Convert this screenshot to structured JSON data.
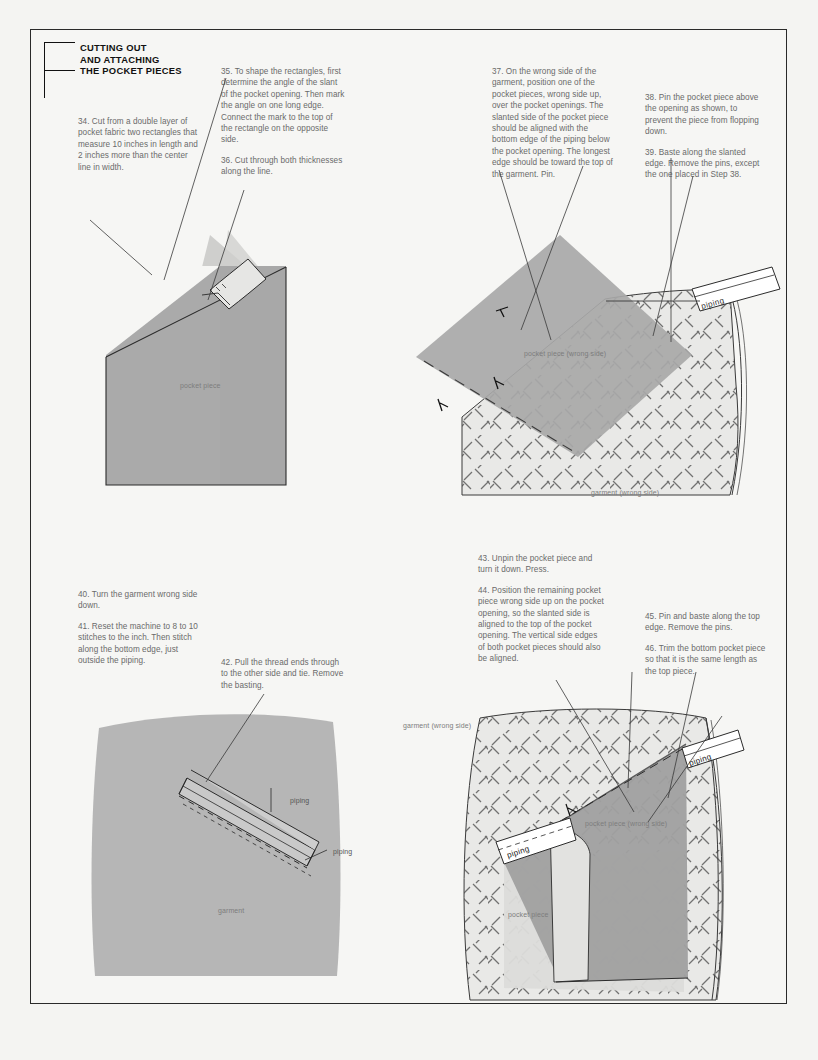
{
  "page": {
    "width": 818,
    "height": 1060,
    "background": "#f4f4f2",
    "sheet_background": "#f6f6f4",
    "border_color": "#2a2a2a"
  },
  "header": {
    "title_line1": "CUTTING OUT",
    "title_line2": "AND ATTACHING",
    "title_line3": "THE POCKET PIECES",
    "bracket": "corner-bracket"
  },
  "steps": {
    "s34": "34. Cut from a double layer of pocket fabric two rectangles that measure 10 inches in length and 2 inches more than the center line in width.",
    "s35": "35. To shape the rectangles, first determine the angle of the slant of the pocket opening. Then mark the angle on one long edge. Connect the mark to the top of the rectangle on the opposite side.",
    "s36": "36. Cut through both thicknesses along the line.",
    "s37": "37. On the wrong side of the garment, position one of the pocket pieces, wrong side up, over the pocket openings. The slanted side of the pocket piece should be aligned with the bottom edge of the piping below the pocket opening. The longest edge should be toward the top of the garment. Pin.",
    "s38": "38. Pin the pocket piece above the opening as shown, to prevent the piece from flopping down.",
    "s39": "39. Baste along the slanted edge. Remove the pins, except the one placed in Step 38.",
    "s40": "40. Turn the garment wrong side down.",
    "s41": "41. Reset the machine to 8 to 10 stitches to the inch. Then stitch along the bottom edge, just outside the piping.",
    "s42": "42. Pull the thread ends through to the other side and tie. Remove the basting.",
    "s43": "43. Unpin the pocket piece and turn it down. Press.",
    "s44": "44. Position the remaining pocket piece wrong side up on the pocket opening, so the slanted side is aligned to the top of the pocket opening. The vertical side edges of both pocket pieces should also be aligned.",
    "s45": "45. Pin and baste along the top edge. Remove the pins.",
    "s46": "46. Trim the bottom pocket piece so that it is the same length as the top piece."
  },
  "figures": {
    "fig1": {
      "name": "cut-pocket-rectangles",
      "labels": {
        "pocket_piece": "pocket piece"
      },
      "colors": {
        "fabric": "#a9a9a9",
        "fabric_under": "#cfcfcf",
        "outline": "#2b2b2b"
      }
    },
    "fig2": {
      "name": "position-pocket-piece-on-garment",
      "labels": {
        "pocket_piece_wrong_side": "pocket piece (wrong side)",
        "garment_wrong_side": "garment (wrong side)",
        "piping": "piping"
      },
      "colors": {
        "pocket": "#a8a8a8",
        "garment": "#e8e8e6",
        "hatch": "#4a4a4a"
      }
    },
    "fig3": {
      "name": "stitch-along-piping",
      "labels": {
        "piping_top": "piping",
        "piping_bottom": "piping",
        "garment": "garment"
      },
      "colors": {
        "garment": "#b4b4b4",
        "welt": "#c9c9c9",
        "outline": "#2b2b2b"
      }
    },
    "fig4": {
      "name": "attach-second-pocket-piece",
      "labels": {
        "garment_wrong_side": "garment (wrong side)",
        "pocket_piece_wrong_side": "pocket piece (wrong side)",
        "pocket_piece": "pocket piece",
        "piping_upper": "piping",
        "piping_lower": "piping"
      },
      "colors": {
        "garment": "#e8e8e6",
        "pocket_dark": "#9e9e9e",
        "pocket_light": "#d6d6d4",
        "hatch": "#4a4a4a"
      }
    }
  }
}
